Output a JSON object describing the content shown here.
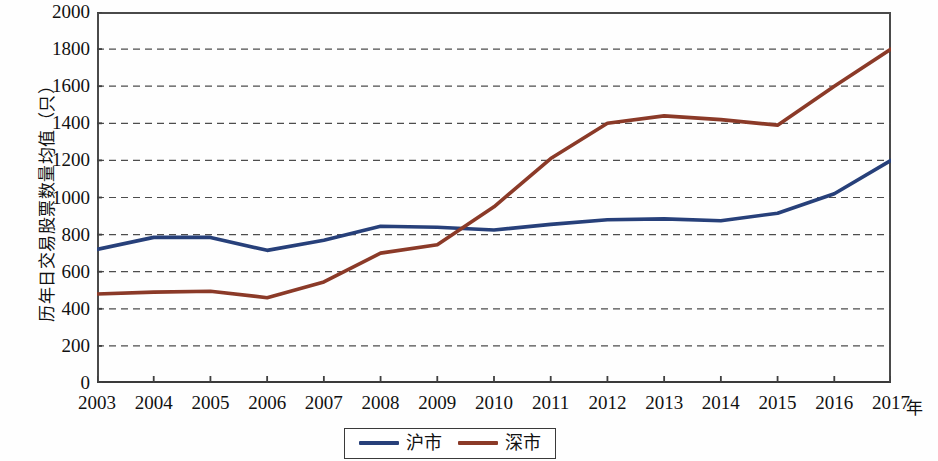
{
  "chart_data": {
    "type": "line",
    "title": "",
    "xlabel": "年",
    "ylabel": "历年日交易股票数量均值（只）",
    "x": [
      2003,
      2004,
      2005,
      2006,
      2007,
      2008,
      2009,
      2010,
      2011,
      2012,
      2013,
      2014,
      2015,
      2016,
      2017
    ],
    "categories": [
      "2003",
      "2004",
      "2005",
      "2006",
      "2007",
      "2008",
      "2009",
      "2010",
      "2011",
      "2012",
      "2013",
      "2014",
      "2015",
      "2016",
      "2017"
    ],
    "series": [
      {
        "name": "沪市",
        "color": "#27407a",
        "values": [
          720,
          785,
          785,
          715,
          770,
          845,
          840,
          825,
          855,
          880,
          885,
          875,
          915,
          1020,
          1200
        ]
      },
      {
        "name": "深市",
        "color": "#8b3a28",
        "values": [
          480,
          490,
          495,
          460,
          545,
          700,
          745,
          950,
          1210,
          1400,
          1440,
          1420,
          1390,
          1600,
          1800
        ]
      }
    ],
    "ylim": [
      0,
      2000
    ],
    "ytick_values": [
      0,
      200,
      400,
      600,
      800,
      1000,
      1200,
      1400,
      1600,
      1800,
      2000
    ],
    "ytick_labels": [
      "0",
      "200",
      "400",
      "600",
      "800",
      "1000",
      "1200",
      "1400",
      "1600",
      "1800",
      "2000"
    ],
    "grid": true,
    "grid_style": "dashed-horizontal",
    "grid_color": "#4d4d4d",
    "legend_position": "bottom-center",
    "axis_color": "#3f3f3f"
  }
}
